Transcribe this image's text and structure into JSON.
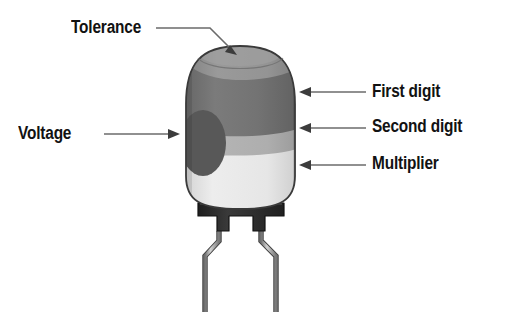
{
  "diagram": {
    "background_color": "#ffffff",
    "labels": {
      "tolerance": "Tolerance",
      "voltage": "Voltage",
      "first_digit": "First digit",
      "second_digit": "Second digit",
      "multiplier": "Multiplier"
    },
    "colors": {
      "text": "#121212",
      "leader_line": "#6b6b6b",
      "band_tolerance": "#8d8d8d",
      "band_first_digit": "#6f6f6f",
      "band_second_digit": "#a9a9a9",
      "band_multiplier": "#e2e2e2",
      "voltage_dot": "#585858",
      "body_outline": "#3a3a3a",
      "base_block": "#2b2b2b",
      "lead_wire": "#9a9a9a"
    },
    "bands": [
      {
        "name": "tolerance",
        "label": "Tolerance",
        "color": "#8d8d8d"
      },
      {
        "name": "first-digit",
        "label": "First digit",
        "color": "#6f6f6f"
      },
      {
        "name": "second-digit",
        "label": "Second digit",
        "color": "#a9a9a9"
      },
      {
        "name": "multiplier",
        "label": "Multiplier",
        "color": "#e2e2e2"
      },
      {
        "name": "voltage",
        "label": "Voltage",
        "color": "#585858"
      }
    ]
  }
}
